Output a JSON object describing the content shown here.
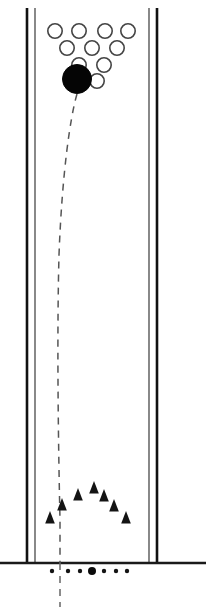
{
  "figure": {
    "width": 206,
    "height": 611,
    "background_color": "#ffffff"
  },
  "colors": {
    "wall_thick": "#111111",
    "wall_thin": "#3a3a3a",
    "floor": "#1a1a1a",
    "open_ball_stroke": "#444444",
    "open_ball_fill": "#ffffff",
    "target_ball": "#050505",
    "trajectory": "#555555",
    "marker": "#141414",
    "dot": "#141414"
  },
  "walls": {
    "left": {
      "label": "left channel wall",
      "thick_x": 27,
      "thin_x": 35,
      "y_top": 8,
      "y_bottom": 563,
      "thick_width": 2.6,
      "thin_width": 1.2
    },
    "right": {
      "label": "right channel wall",
      "thick_x": 157,
      "thin_x": 149,
      "y_top": 8,
      "y_bottom": 563,
      "thick_width": 2.6,
      "thin_width": 1.2
    }
  },
  "floor": {
    "label": "floor line",
    "x_start": 0,
    "x_end": 206,
    "y": 563,
    "stroke_width": 2.4
  },
  "ball_cluster": {
    "label": "packed ball cluster",
    "open_ball_radius": 7.2,
    "open_ball_stroke_width": 1.6,
    "rows": [
      {
        "row": 1,
        "y": 31,
        "count": 4,
        "centers_x": [
          55,
          79,
          105,
          128
        ]
      },
      {
        "row": 2,
        "y": 48,
        "count": 3,
        "centers_x": [
          67,
          92,
          117
        ]
      },
      {
        "row": 3,
        "y": 65,
        "count": 2,
        "centers_x": [
          79,
          104
        ]
      },
      {
        "row": 4,
        "y": 81,
        "count": 1,
        "centers_x": [
          97
        ]
      }
    ]
  },
  "target_ball": {
    "label": "struck ball",
    "cx": 77,
    "cy": 79,
    "r": 14.5
  },
  "trajectory": {
    "label": "dashed trajectory of struck ball",
    "dash_pattern": "7 6",
    "stroke_width": 1.5,
    "path": "M 77 94 C 70 118, 62 175, 59 255 C 57 330, 58 430, 60 520 L 60 563",
    "tail": {
      "label": "trajectory continuation below floor",
      "path": "M 60 563 L 60 607",
      "dash_pattern": "7 6",
      "stroke_width": 1.5
    }
  },
  "markers": {
    "label": "arc of triangular markers",
    "shape": "triangle",
    "size": 8,
    "points": [
      {
        "x": 50,
        "y": 519
      },
      {
        "x": 62,
        "y": 506
      },
      {
        "x": 78,
        "y": 496
      },
      {
        "x": 94,
        "y": 489
      },
      {
        "x": 104,
        "y": 497
      },
      {
        "x": 114,
        "y": 507
      },
      {
        "x": 126,
        "y": 519
      }
    ]
  },
  "floor_dots": {
    "label": "dots along the floor",
    "y": 571,
    "radius_minor": 2.2,
    "radius_major": 4.0,
    "points": [
      {
        "x": 52,
        "size": "minor"
      },
      {
        "x": 68,
        "size": "minor"
      },
      {
        "x": 80,
        "size": "minor"
      },
      {
        "x": 92,
        "size": "major"
      },
      {
        "x": 104,
        "size": "minor"
      },
      {
        "x": 116,
        "size": "minor"
      },
      {
        "x": 127,
        "size": "minor"
      }
    ]
  }
}
